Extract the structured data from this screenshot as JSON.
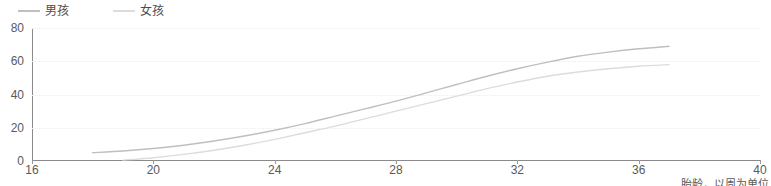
{
  "legend": {
    "position": "top-left",
    "entries": [
      {
        "label": "男孩",
        "color": "#bfbfbf",
        "name": "boys"
      },
      {
        "label": "女孩",
        "color": "#dcdcdc",
        "name": "girls"
      }
    ]
  },
  "axes": {
    "x": {
      "label": "胎龄，以周为单位",
      "ticks": [
        "16",
        "20",
        "24",
        "28",
        "32",
        "36",
        "40"
      ],
      "min": 16,
      "max": 40
    },
    "y": {
      "label": "",
      "ticks": [
        "0",
        "20",
        "40",
        "60",
        "80"
      ],
      "min": 0,
      "max": 80
    },
    "grid": "horizontal-dotted"
  },
  "chart_data": {
    "type": "line",
    "title": "",
    "subtitle": "",
    "xlabel": "胎龄，以周为单位",
    "ylabel": "",
    "xlim": [
      16,
      40
    ],
    "ylim": [
      0,
      80
    ],
    "xticks": [
      16,
      20,
      24,
      28,
      32,
      36,
      40
    ],
    "yticks": [
      0,
      20,
      40,
      60,
      80
    ],
    "grid": true,
    "legend_position": "top-left",
    "series": [
      {
        "name": "男孩",
        "color": "#bfbfbf",
        "x": [
          18,
          19,
          20,
          21,
          22,
          23,
          24,
          25,
          26,
          27,
          28,
          29,
          30,
          31,
          32,
          33,
          34,
          35,
          36,
          37
        ],
        "values": [
          5,
          6,
          7.5,
          9.5,
          12,
          15,
          18.5,
          22.5,
          27,
          31.5,
          36,
          41,
          46,
          51,
          55.5,
          59.5,
          63,
          65.5,
          67.5,
          69
        ]
      },
      {
        "name": "女孩",
        "color": "#dcdcdc",
        "x": [
          19,
          20,
          21,
          22,
          23,
          24,
          25,
          26,
          27,
          28,
          29,
          30,
          31,
          32,
          33,
          34,
          35,
          36,
          37
        ],
        "values": [
          0.5,
          2,
          4,
          6.5,
          9.5,
          13,
          17,
          21,
          25.5,
          30,
          34.5,
          39,
          43.5,
          47.5,
          51,
          53.5,
          55.5,
          57,
          58
        ]
      }
    ]
  }
}
